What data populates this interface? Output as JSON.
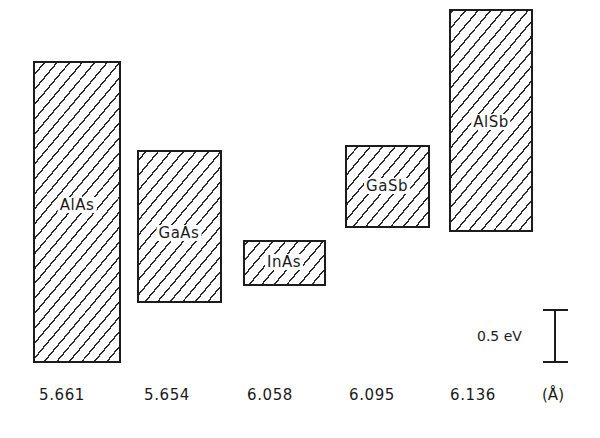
{
  "chart_data": {
    "type": "bar",
    "subtype": "floating-range (band-edge alignment)",
    "title": "",
    "xlabel": "Lattice constant (Å)",
    "ylabel": "Energy (eV)",
    "unit_label": "(Å)",
    "categories": [
      "AlAs",
      "GaAs",
      "InAs",
      "GaSb",
      "AlSb"
    ],
    "lattice_constants": [
      "5.661",
      "5.654",
      "6.058",
      "6.095",
      "6.136"
    ],
    "series": [
      {
        "name": "lower edge (eV, relative to AlAs lower edge)",
        "values": [
          0.0,
          0.58,
          0.74,
          1.3,
          1.26
        ]
      },
      {
        "name": "upper edge (eV, relative to AlAs lower edge)",
        "values": [
          2.88,
          2.03,
          1.16,
          2.08,
          3.38
        ]
      }
    ],
    "gaps_ev": [
      2.88,
      1.45,
      0.42,
      0.78,
      2.12
    ],
    "scale_bar": {
      "label": "0.5 eV",
      "value_ev": 0.5
    },
    "grid": false,
    "legend": "none",
    "fill": "diagonal hatch"
  },
  "boxes": [
    {
      "label": "AlAs",
      "lattice": "5.661",
      "bottom_ev": 0.0,
      "top_ev": 2.88,
      "x": 33,
      "w": 88,
      "label_ev": 1.5,
      "label_x": 77
    },
    {
      "label": "GaAs",
      "lattice": "5.654",
      "bottom_ev": 0.58,
      "top_ev": 2.03,
      "x": 137,
      "w": 85,
      "label_ev": 1.23,
      "label_x": 179
    },
    {
      "label": "InAs",
      "lattice": "6.058",
      "bottom_ev": 0.74,
      "top_ev": 1.16,
      "x": 243,
      "w": 83,
      "label_ev": 0.95,
      "label_x": 284
    },
    {
      "label": "GaSb",
      "lattice": "6.095",
      "bottom_ev": 1.3,
      "top_ev": 2.08,
      "x": 345,
      "w": 85,
      "label_ev": 1.68,
      "label_x": 387
    },
    {
      "label": "AlSb",
      "lattice": "6.136",
      "bottom_ev": 1.26,
      "top_ev": 3.38,
      "x": 449,
      "w": 84,
      "label_ev": 2.3,
      "label_x": 491
    }
  ],
  "axis": {
    "zero_px": 361,
    "px_per_ev": 104,
    "tick_positions_x": [
      62,
      167,
      270,
      372,
      473
    ]
  },
  "scale": {
    "label": "0.5 eV"
  },
  "unit": "(Å)"
}
